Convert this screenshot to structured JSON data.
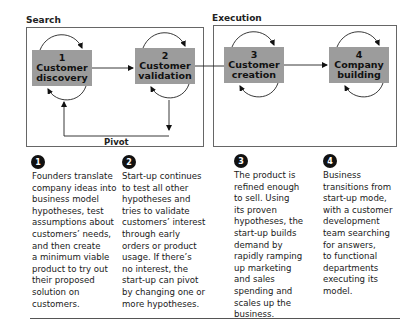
{
  "sections": {
    "search": {
      "label": "Search"
    },
    "execution": {
      "label": "Execution"
    }
  },
  "stages": [
    {
      "number": "1",
      "line1": "Customer",
      "line2": "discovery"
    },
    {
      "number": "2",
      "line1": "Customer",
      "line2": "validation"
    },
    {
      "number": "3",
      "line1": "Customer",
      "line2": "creation"
    },
    {
      "number": "4",
      "line1": "Company",
      "line2": "building"
    }
  ],
  "pivot": {
    "label": "Pivot"
  },
  "descriptions": [
    {
      "number": "1",
      "text": "Founders translate\ncompany ideas into\nbusiness model\nhypotheses, test\nassumptions about\ncustomers’ needs,\nand then create\na minimum viable\nproduct to try out\ntheir proposed\nsolution on\ncustomers."
    },
    {
      "number": "2",
      "text": "Start-up continues\nto test all other\nhypotheses and\ntries to validate\ncustomers’ interest\nthrough early\norders or product\nusage. If there’s\nno interest, the\nstart-up can pivot\nby changing one or\nmore hypotheses."
    },
    {
      "number": "3",
      "text": "The product is\nrefined enough\nto sell. Using\nits proven\nhypotheses, the\nstart-up builds\ndemand by\nrapidly ramping\nup marketing\nand sales\nspending and\nscales up the\nbusiness."
    },
    {
      "number": "4",
      "text": "Business\ntransitions from\nstart-up mode,\nwith a customer\ndevelopment\nteam searching\nfor answers,\nto functional\ndepartments\nexecuting its\nmodel."
    }
  ],
  "colors": {
    "box_fill": "#9c9c9c",
    "frame": "#666666",
    "number_badge": "#111111"
  }
}
